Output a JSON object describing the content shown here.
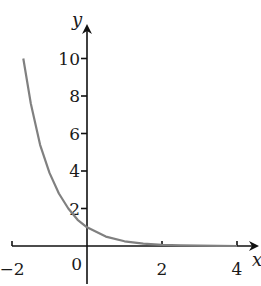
{
  "chart_data": {
    "type": "line",
    "title": "",
    "xlabel": "x",
    "ylabel": "y",
    "xlim": [
      -2,
      4.5
    ],
    "ylim": [
      0,
      11
    ],
    "grid": false,
    "legend": null,
    "x_ticks": [
      -2,
      0,
      2,
      4
    ],
    "x_tick_labels": [
      "−2",
      "0",
      "2",
      "4"
    ],
    "y_ticks": [
      2,
      4,
      6,
      8,
      10
    ],
    "y_tick_labels": [
      "2",
      "4",
      "6",
      "8",
      "10"
    ],
    "series": [
      {
        "name": "curve",
        "color": "#808080",
        "x": [
          -1.7,
          -1.5,
          -1.25,
          -1.0,
          -0.75,
          -0.5,
          -0.25,
          0,
          0.5,
          1.0,
          1.5,
          2.0,
          2.5,
          3.0,
          3.5,
          4.0
        ],
        "y": [
          10.0,
          7.6,
          5.4,
          3.9,
          2.8,
          2.0,
          1.4,
          1.0,
          0.5,
          0.25,
          0.13,
          0.06,
          0.03,
          0.02,
          0.01,
          0.0
        ]
      }
    ]
  }
}
